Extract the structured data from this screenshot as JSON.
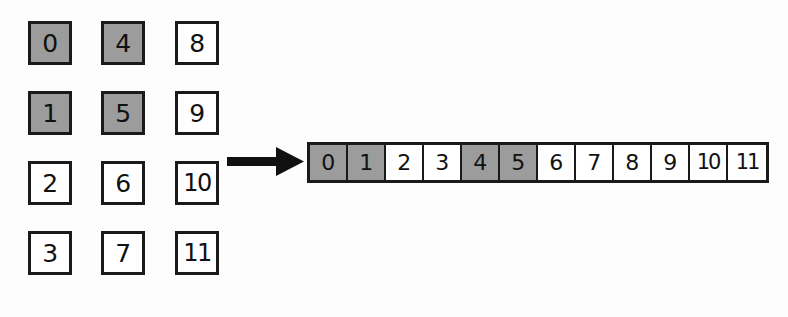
{
  "diagram": {
    "type": "array-flattening",
    "background_color": "#fdfdfd",
    "border_color": "#1a1a1a",
    "highlight_color": "#9c9c9c",
    "empty_color": "#ffffff",
    "grid_2d": {
      "rows": 4,
      "columns": 3,
      "order": "column-major",
      "cells": [
        {
          "value": "0",
          "row": 0,
          "col": 0,
          "highlighted": true
        },
        {
          "value": "4",
          "row": 0,
          "col": 1,
          "highlighted": true
        },
        {
          "value": "8",
          "row": 0,
          "col": 2,
          "highlighted": false
        },
        {
          "value": "1",
          "row": 1,
          "col": 0,
          "highlighted": true
        },
        {
          "value": "5",
          "row": 1,
          "col": 1,
          "highlighted": true
        },
        {
          "value": "9",
          "row": 1,
          "col": 2,
          "highlighted": false
        },
        {
          "value": "2",
          "row": 2,
          "col": 0,
          "highlighted": false
        },
        {
          "value": "6",
          "row": 2,
          "col": 1,
          "highlighted": false
        },
        {
          "value": "10",
          "row": 2,
          "col": 2,
          "highlighted": false
        },
        {
          "value": "3",
          "row": 3,
          "col": 0,
          "highlighted": false
        },
        {
          "value": "7",
          "row": 3,
          "col": 1,
          "highlighted": false
        },
        {
          "value": "11",
          "row": 3,
          "col": 2,
          "highlighted": false
        }
      ]
    },
    "arrow": {
      "icon": "right-arrow-icon",
      "direction": "right",
      "color": "#111111"
    },
    "array_1d": {
      "length": 12,
      "cells": [
        {
          "value": "0",
          "index": 0,
          "highlighted": true
        },
        {
          "value": "1",
          "index": 1,
          "highlighted": true
        },
        {
          "value": "2",
          "index": 2,
          "highlighted": false
        },
        {
          "value": "3",
          "index": 3,
          "highlighted": false
        },
        {
          "value": "4",
          "index": 4,
          "highlighted": true
        },
        {
          "value": "5",
          "index": 5,
          "highlighted": true
        },
        {
          "value": "6",
          "index": 6,
          "highlighted": false
        },
        {
          "value": "7",
          "index": 7,
          "highlighted": false
        },
        {
          "value": "8",
          "index": 8,
          "highlighted": false
        },
        {
          "value": "9",
          "index": 9,
          "highlighted": false
        },
        {
          "value": "10",
          "index": 10,
          "highlighted": false
        },
        {
          "value": "11",
          "index": 11,
          "highlighted": false
        }
      ]
    }
  }
}
